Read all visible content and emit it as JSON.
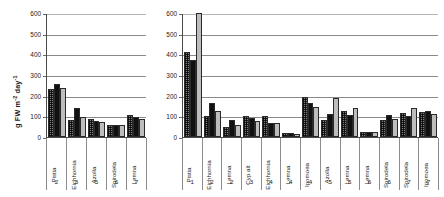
{
  "chart_data": [
    {
      "id": "left",
      "type": "bar",
      "title": "",
      "xlabel": "",
      "ylabel": "g FW m-2 day-1",
      "ylabel_parts": {
        "main": "g FW m",
        "sup1": "-2",
        "mid": " day",
        "sup2": "-1"
      },
      "ylim": [
        0,
        600
      ],
      "yticks": [
        600,
        500,
        400,
        300,
        200,
        100,
        0
      ],
      "grid": true,
      "legend": "none",
      "categories": [
        "Pistia",
        "Eichhornia",
        "Azolla",
        "Spirodela",
        "Lemna"
      ],
      "category_numbers": [
        "2",
        "3",
        "5",
        "6",
        "7"
      ],
      "series": [
        {
          "name": "series-1-dotted",
          "pattern": "dotted",
          "color": "#7d7d7d",
          "values": [
            230,
            82,
            86,
            56,
            105
          ]
        },
        {
          "name": "series-2-black",
          "pattern": "solid-black",
          "color": "#111111",
          "values": [
            257,
            138,
            78,
            60,
            98
          ]
        },
        {
          "name": "series-3-gray",
          "pattern": "solid-gray",
          "color": "#bdbdbd",
          "values": [
            235,
            97,
            72,
            58,
            85
          ]
        }
      ]
    },
    {
      "id": "right",
      "type": "bar",
      "title": "",
      "xlabel": "",
      "ylabel": "",
      "ylim": [
        0,
        600
      ],
      "yticks": [
        600,
        500,
        400,
        300,
        200,
        100,
        0
      ],
      "grid": true,
      "legend": "none",
      "categories": [
        "Pistia",
        "Eichhornia",
        "Lemna",
        "Cyp alt",
        "Eichhornia",
        "Lemna",
        "Ipomoea",
        "Azolla",
        "Lemna",
        "Lemna",
        "Spirodela",
        "Spirodela",
        "Ipomoea"
      ],
      "category_numbers": [
        "1",
        "2",
        "2",
        "3",
        "4",
        "4",
        "4",
        "5",
        "5",
        "6",
        "6",
        "7",
        "7"
      ],
      "series": [
        {
          "name": "series-1-dotted",
          "pattern": "dotted",
          "color": "#7d7d7d",
          "values": [
            410,
            100,
            48,
            103,
            102,
            20,
            195,
            82,
            124,
            22,
            80,
            118,
            122
          ]
        },
        {
          "name": "series-2-black",
          "pattern": "solid-black",
          "color": "#111111",
          "values": [
            375,
            165,
            82,
            90,
            70,
            20,
            166,
            113,
            107,
            22,
            105,
            102,
            124
          ]
        },
        {
          "name": "series-3-gray",
          "pattern": "solid-gray",
          "color": "#bdbdbd",
          "values": [
            640,
            126,
            60,
            78,
            69,
            17,
            143,
            190,
            140,
            23,
            89,
            140,
            112
          ]
        }
      ]
    }
  ]
}
